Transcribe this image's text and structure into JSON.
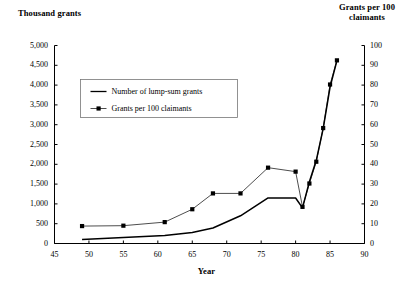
{
  "chart_data": {
    "type": "line",
    "title": "",
    "xlabel": "Year",
    "ylabel": "Thousand grants",
    "ylabel_right": "Grants per 100\nclaimants",
    "xlim": [
      45,
      90
    ],
    "ylim": [
      0,
      5000
    ],
    "ylim_right": [
      0,
      100
    ],
    "xticks": [
      45,
      50,
      55,
      60,
      65,
      70,
      75,
      80,
      85,
      90
    ],
    "xticklabels": [
      "45",
      "50",
      "55",
      "60",
      "65",
      "70",
      "75",
      "80",
      "85",
      "90"
    ],
    "yticks": [
      0,
      500,
      1000,
      1500,
      2000,
      2500,
      3000,
      3500,
      4000,
      4500,
      5000
    ],
    "yticklabels": [
      "0",
      "500",
      "1,000",
      "1,500",
      "2,000",
      "2,500",
      "3,000",
      "3,500",
      "4,000",
      "4,500",
      "5,000"
    ],
    "yticks_right": [
      0,
      10,
      20,
      30,
      40,
      50,
      60,
      70,
      80,
      90,
      100
    ],
    "yticklabels_right": [
      "0",
      "10",
      "20",
      "30",
      "40",
      "50",
      "60",
      "70",
      "80",
      "90",
      "100"
    ],
    "grid": false,
    "legend_position": "upper left",
    "series": [
      {
        "name": "Number of lump-sum grants",
        "axis": "left",
        "marker": "none",
        "x": [
          49,
          55,
          61,
          65,
          68,
          72,
          76,
          80,
          81,
          82,
          83,
          84,
          85,
          86
        ],
        "values": [
          100,
          150,
          200,
          280,
          390,
          700,
          1150,
          1150,
          900,
          1560,
          2100,
          2900,
          3950,
          4620
        ]
      },
      {
        "name": "Grants per 100 claimants",
        "axis": "right",
        "marker": "square",
        "x": [
          49,
          55,
          61,
          65,
          68,
          72,
          76,
          80,
          81,
          82,
          83,
          84,
          85,
          86
        ],
        "values": [
          8.8,
          9.0,
          10.8,
          17.3,
          25.3,
          25.3,
          38.3,
          36.3,
          18.5,
          30.3,
          41.3,
          58.3,
          80.3,
          92.5
        ]
      }
    ]
  },
  "legend": {
    "entries": [
      {
        "label": "Number of lump-sum grants",
        "symbol": "line"
      },
      {
        "label": "Grants per 100 claimants",
        "symbol": "line-marker"
      }
    ]
  },
  "colors": {
    "series_left": "#000000",
    "series_right": "#000000",
    "axis": "#000000",
    "background": "#ffffff"
  }
}
